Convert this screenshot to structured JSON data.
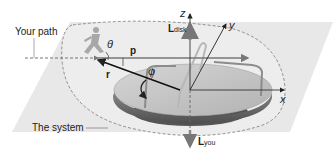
{
  "diagram": {
    "labels": {
      "your_path": "Your path",
      "the_system": "The system",
      "theta": "θ",
      "phi": "φ",
      "p_vec": "p",
      "r_vec": "r",
      "L_disk_main": "L",
      "L_disk_sub": "disk",
      "L_you_main": "L",
      "L_you_sub": "you",
      "axis_x": "x",
      "axis_y": "y",
      "axis_z": "z"
    },
    "colors": {
      "plane": "#e6e6e6",
      "disk_top": "#c4c4c4",
      "disk_rim": "#6e6e6e",
      "disk_base": "#8a8a8a",
      "axes": "#333333",
      "dashed": "#777777",
      "vector": "#111111",
      "runner": "#a8a8a8"
    }
  }
}
